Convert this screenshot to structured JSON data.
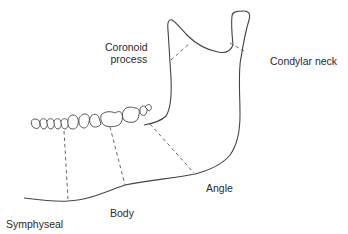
{
  "diagram": {
    "labels": {
      "coronoid_line1": "Coronoid",
      "coronoid_line2": "process",
      "condylar_neck": "Condylar neck",
      "angle": "Angle",
      "body": "Body",
      "symphyseal": "Symphyseal"
    },
    "colors": {
      "line": "#444444",
      "text": "#2a2a2a",
      "background": "#ffffff"
    }
  }
}
